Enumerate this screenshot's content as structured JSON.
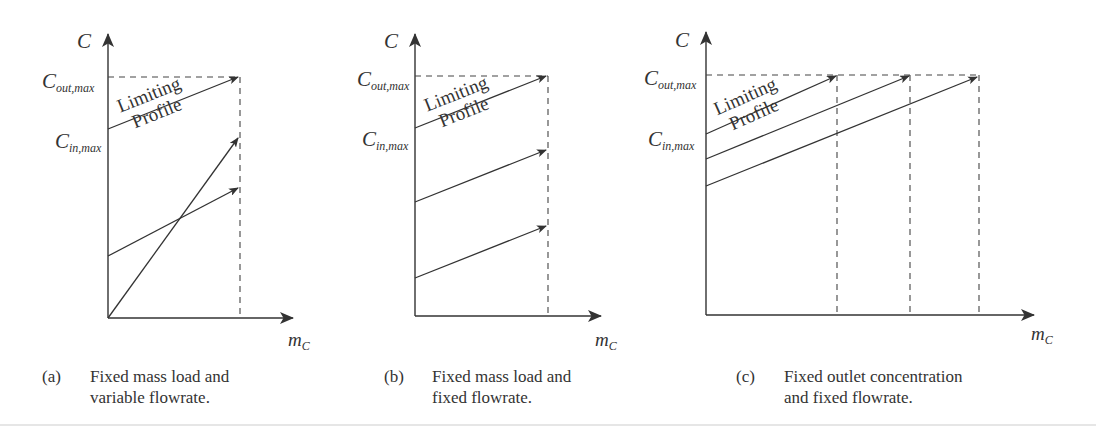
{
  "colors": {
    "line": "#333333",
    "dash": "#444444",
    "text": "#333333",
    "background": "#ffffff"
  },
  "labels": {
    "y_axis": "C",
    "x_axis_main": "m",
    "x_axis_sub": "C",
    "c_out_main": "C",
    "c_out_sub": "out,max",
    "c_in_main": "C",
    "c_in_sub": "in,max",
    "limiting_line1": "Limiting",
    "limiting_line2": "Profile"
  },
  "panels": [
    {
      "id": "a",
      "tag": "(a)",
      "caption_line1": "Fixed mass load and",
      "caption_line2": "variable flowrate."
    },
    {
      "id": "b",
      "tag": "(b)",
      "caption_line1": "Fixed mass load and",
      "caption_line2": "fixed flowrate."
    },
    {
      "id": "c",
      "tag": "(c)",
      "caption_line1": "Fixed outlet concentration",
      "caption_line2": "and fixed flowrate."
    }
  ]
}
